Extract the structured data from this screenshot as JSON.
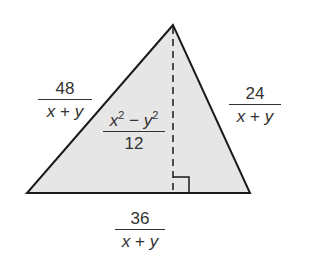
{
  "figure": {
    "type": "triangle",
    "fill_color": "#e6e6e6",
    "stroke_color": "#1a1a1a",
    "vertices": {
      "apex": [
        173,
        25
      ],
      "bottom_left": [
        27,
        193
      ],
      "bottom_right": [
        250,
        193
      ]
    },
    "altitude": {
      "style": "dashed",
      "right_angle_marker": true
    }
  },
  "labels": {
    "left_side": {
      "numerator": "48",
      "denominator_x": "x",
      "denominator_op": "+",
      "denominator_y": "y"
    },
    "right_side": {
      "numerator": "24",
      "denominator_x": "x",
      "denominator_op": "+",
      "denominator_y": "y"
    },
    "base": {
      "numerator": "36",
      "denominator_x": "x",
      "denominator_op": "+",
      "denominator_y": "y"
    },
    "area": {
      "num_x": "x",
      "num_exp1": "2",
      "num_minus": "−",
      "num_y": "y",
      "num_exp2": "2",
      "denominator": "12"
    }
  }
}
